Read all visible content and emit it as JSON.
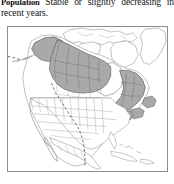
{
  "document": {
    "section_label": "Population",
    "body_text": "Stable or slightly decreasing in recent years.",
    "body_line_1": "Stable or slightly decreas-",
    "body_line_2": "ing in recent years."
  },
  "map": {
    "name": "north-america-range-map",
    "title": "North America range map",
    "region": "North America",
    "projection_note": "continental outline with state and province subdivisions",
    "frame": {
      "x": 7,
      "y": 26,
      "width": 161,
      "height": 146,
      "border_color": "#8e8e8e",
      "background_color": "#fdfdfd"
    },
    "legend": {
      "range_shading_label": "breeding / core range",
      "route_label": "migration route"
    },
    "colors": {
      "range_fill": "#a9a9a9",
      "range_outline": "#5e5e5e",
      "land_fill": "#ffffff",
      "land_outline": "#8d8d8d",
      "subdivision_outline": "#a3a3a3",
      "route_line": "#2f2f2f",
      "water_fill": "#ffffff"
    },
    "shaded_regions": [
      "Alaska",
      "Yukon",
      "Northwest Territories",
      "northern British Columbia",
      "northern Alberta",
      "northern Saskatchewan",
      "northern Manitoba",
      "northern Ontario",
      "Quebec",
      "Labrador",
      "Newfoundland",
      "Maritime provinces"
    ],
    "unshaded_features": [
      "Hudson Bay",
      "contiguous United States",
      "Mexico",
      "Caribbean islands",
      "Greenland"
    ],
    "route_description": "dashed line running from the northern plains southeast through the central United States to the Gulf coast"
  }
}
